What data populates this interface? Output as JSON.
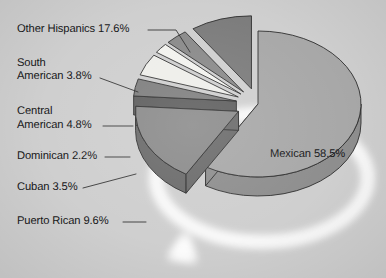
{
  "chart_data": {
    "type": "pie",
    "title": "",
    "subtitle": "",
    "xlabel": "",
    "ylabel": "",
    "style": "3d-exploded-pie",
    "legend_position": "none",
    "grid": false,
    "units": "percent",
    "total": 100.0,
    "categories": [
      "Mexican",
      "Other Hispanics",
      "South American",
      "Central American",
      "Dominican",
      "Cuban",
      "Puerto Rican"
    ],
    "values": [
      58.5,
      17.6,
      3.8,
      4.8,
      2.2,
      3.5,
      9.6
    ],
    "slices": [
      {
        "name": "Mexican",
        "value": 58.5,
        "label": "Mexican 58.5%",
        "color": "#a8a8a8",
        "side_color": "#8e8e8e",
        "exploded": false,
        "label_placement": "inside"
      },
      {
        "name": "Other Hispanics",
        "value": 17.6,
        "label": "Other Hispanics 17.6%",
        "color": "#8b8b8b",
        "side_color": "#6b6b6b",
        "exploded": true,
        "label_placement": "outside-left"
      },
      {
        "name": "South American",
        "value": 3.8,
        "label": "South\nAmerican 3.8%",
        "color": "#7f7f7f",
        "side_color": "#5f5f5f",
        "exploded": true,
        "label_placement": "outside-left"
      },
      {
        "name": "Central American",
        "value": 4.8,
        "label": "Central\nAmerican 4.8%",
        "color": "#eeeeea",
        "side_color": "#c4c4c0",
        "exploded": true,
        "label_placement": "outside-left"
      },
      {
        "name": "Dominican",
        "value": 2.2,
        "label": "Dominican 2.2%",
        "color": "#f2f2ee",
        "side_color": "#c8c8c4",
        "exploded": true,
        "label_placement": "outside-left"
      },
      {
        "name": "Cuban",
        "value": 3.5,
        "label": "Cuban 3.5%",
        "color": "#8a8a8a",
        "side_color": "#686868",
        "exploded": true,
        "label_placement": "outside-left"
      },
      {
        "name": "Puerto Rican",
        "value": 9.6,
        "label": "Puerto Rican 9.6%",
        "color": "#7c7c7c",
        "side_color": "#5c5c5c",
        "exploded": true,
        "label_placement": "outside-left"
      }
    ],
    "background_color": "#cfcfcf",
    "text_color": "#18181a",
    "leader_line_color": "#2a2a2a"
  },
  "labels": {
    "other_hispanics": "Other Hispanics 17.6%",
    "south_american_l1": "South",
    "south_american_l2": "American 3.8%",
    "central_american_l1": "Central",
    "central_american_l2": "American 4.8%",
    "dominican": "Dominican 2.2%",
    "cuban": "Cuban 3.5%",
    "puerto_rican": "Puerto Rican 9.6%",
    "mexican": "Mexican 58.5%"
  }
}
